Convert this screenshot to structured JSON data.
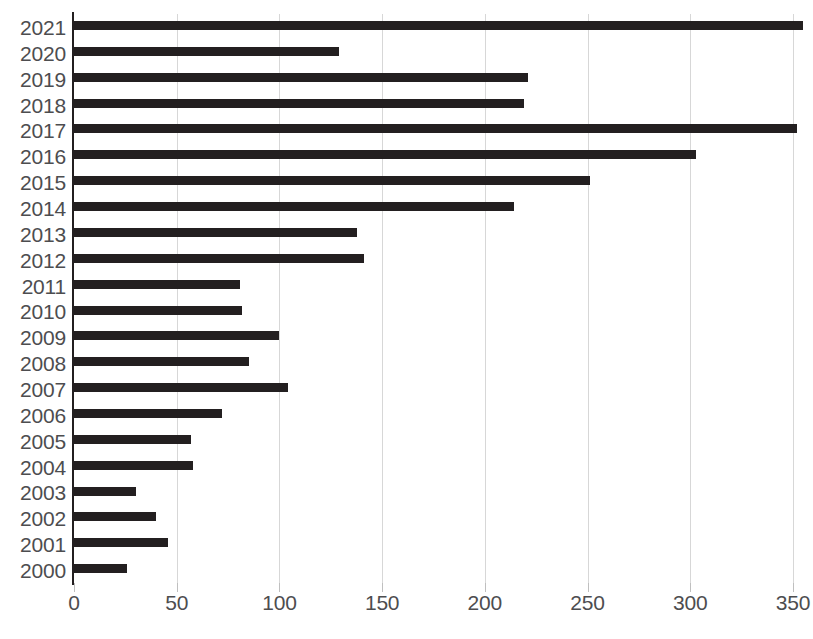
{
  "chart_data": {
    "type": "bar",
    "orientation": "horizontal",
    "title": "",
    "subtitle": "",
    "xlabel": "",
    "ylabel": "",
    "xlim": [
      0,
      365
    ],
    "grid": "vertical",
    "legend": "none",
    "bar_color": "#231f20",
    "grid_color": "#d7d7d7",
    "label_color": "#4d4d4f",
    "xticks": [
      0,
      50,
      100,
      150,
      200,
      250,
      300,
      350
    ],
    "xtick_labels": [
      "0",
      "50",
      "100",
      "150",
      "200",
      "250",
      "300",
      "350"
    ],
    "categories": [
      "2021",
      "2020",
      "2019",
      "2018",
      "2017",
      "2016",
      "2015",
      "2014",
      "2013",
      "2012",
      "2011",
      "2010",
      "2009",
      "2008",
      "2007",
      "2006",
      "2005",
      "2004",
      "2003",
      "2002",
      "2001",
      "2000"
    ],
    "values": [
      355,
      129,
      221,
      219,
      352,
      303,
      251,
      214,
      138,
      141,
      81,
      82,
      100,
      85,
      104,
      72,
      57,
      58,
      30,
      40,
      46,
      26
    ],
    "bars": [
      {
        "category": "2021",
        "value": 355
      },
      {
        "category": "2020",
        "value": 129
      },
      {
        "category": "2019",
        "value": 221
      },
      {
        "category": "2018",
        "value": 219
      },
      {
        "category": "2017",
        "value": 352
      },
      {
        "category": "2016",
        "value": 303
      },
      {
        "category": "2015",
        "value": 251
      },
      {
        "category": "2014",
        "value": 214
      },
      {
        "category": "2013",
        "value": 138
      },
      {
        "category": "2012",
        "value": 141
      },
      {
        "category": "2011",
        "value": 81
      },
      {
        "category": "2010",
        "value": 82
      },
      {
        "category": "2009",
        "value": 100
      },
      {
        "category": "2008",
        "value": 85
      },
      {
        "category": "2007",
        "value": 104
      },
      {
        "category": "2006",
        "value": 72
      },
      {
        "category": "2005",
        "value": 57
      },
      {
        "category": "2004",
        "value": 58
      },
      {
        "category": "2003",
        "value": 30
      },
      {
        "category": "2002",
        "value": 40
      },
      {
        "category": "2001",
        "value": 46
      },
      {
        "category": "2000",
        "value": 26
      }
    ]
  },
  "footnote": {
    "text": ""
  }
}
